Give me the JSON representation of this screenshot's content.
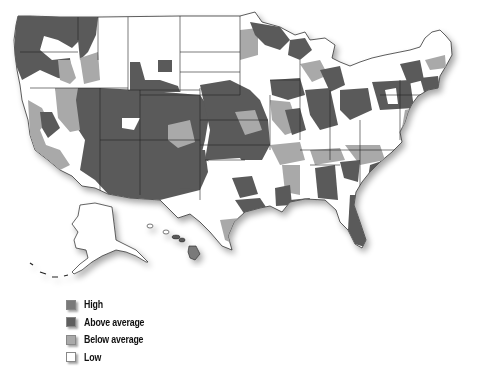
{
  "map": {
    "type": "choropleth",
    "region": "United States",
    "shades": {
      "high": "#7a7a7a",
      "above_average": "#5a5a5a",
      "below_average": "#a9a9a9",
      "low": "#ffffff",
      "border": "#222222"
    }
  },
  "legend": {
    "items": [
      {
        "key": "high",
        "label": "High",
        "color": "#7a7a7a"
      },
      {
        "key": "above_average",
        "label": "Above average",
        "color": "#5e5e5e"
      },
      {
        "key": "below_average",
        "label": "Below average",
        "color": "#a9a9a9"
      },
      {
        "key": "low",
        "label": "Low",
        "color": "#ffffff"
      }
    ]
  }
}
